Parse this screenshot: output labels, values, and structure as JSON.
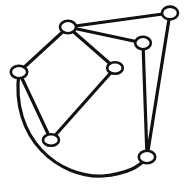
{
  "figure": {
    "background_color": "#ffffff",
    "width": 189,
    "height": 193
  },
  "style": {
    "edge_color": "#111111",
    "edge_width": 3.2,
    "node_fill": "#ffffff",
    "node_stroke": "#111111",
    "node_stroke_width": 2.6,
    "node_rx": 7.5,
    "node_ry": 6.0
  },
  "graph": {
    "node_count": 7,
    "edge_count": 8,
    "nodes": [
      {
        "id": "n1",
        "label": "",
        "x": 68,
        "y": 27,
        "rx": 8.0,
        "ry": 6.2
      },
      {
        "id": "n2",
        "label": "",
        "x": 170,
        "y": 13,
        "rx": 8.0,
        "ry": 6.4
      },
      {
        "id": "n3",
        "label": "",
        "x": 143,
        "y": 43,
        "rx": 7.8,
        "ry": 6.2
      },
      {
        "id": "n4",
        "label": "",
        "x": 115,
        "y": 68,
        "rx": 7.8,
        "ry": 5.8
      },
      {
        "id": "n5",
        "label": "",
        "x": 19,
        "y": 72,
        "rx": 8.2,
        "ry": 6.2
      },
      {
        "id": "n6",
        "label": "",
        "x": 51,
        "y": 140,
        "rx": 8.0,
        "ry": 5.8
      },
      {
        "id": "n7",
        "label": "",
        "x": 147,
        "y": 157,
        "rx": 8.2,
        "ry": 6.2
      }
    ],
    "edges": [
      {
        "id": "e1",
        "from": "n1",
        "to": "n2",
        "shape": "straight",
        "path": "M 68 27 L 170 13"
      },
      {
        "id": "e2",
        "from": "n1",
        "to": "n3",
        "shape": "straight",
        "path": "M 68 27 L 143 43"
      },
      {
        "id": "e3",
        "from": "n1",
        "to": "n4",
        "shape": "straight",
        "path": "M 68 27 L 115 68"
      },
      {
        "id": "e4",
        "from": "n1",
        "to": "n5",
        "shape": "straight",
        "path": "M 68 27 L 19 72"
      },
      {
        "id": "e5",
        "from": "n4",
        "to": "n6",
        "shape": "straight",
        "path": "M 115 68 L 51 140"
      },
      {
        "id": "e6",
        "from": "n5",
        "to": "n6",
        "shape": "straight",
        "path": "M 19 72 L 51 140"
      },
      {
        "id": "e7",
        "from": "n3",
        "to": "n7",
        "shape": "straight",
        "path": "M 143 43 L 147 157"
      },
      {
        "id": "e8",
        "from": "n2",
        "to": "n7",
        "shape": "straight",
        "path": "M 170 13 L 147 157"
      },
      {
        "id": "e9",
        "from": "n5",
        "to": "n7",
        "shape": "curved-arc",
        "path": "M 19 72 C 10 140 60 178 103 176 C 125 174 140 167 147 157"
      }
    ]
  }
}
